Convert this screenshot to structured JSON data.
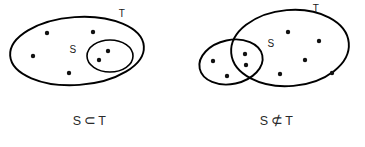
{
  "figure": {
    "background_color": "#ffffff",
    "stroke_color": "#000000",
    "dot_color": "#111111",
    "title": ""
  },
  "panels": [
    {
      "id": "subset",
      "name": "subset-panel",
      "caption": {
        "left_operand": "S",
        "relation_symbol": "⊂",
        "relation_name": "subset-of",
        "right_operand": "T",
        "full_text": "S ⊂ T"
      },
      "sets": [
        {
          "label": "T",
          "role": "outer-set",
          "label_x": 122,
          "label_y": 17,
          "shape": "ellipse",
          "cx": 77,
          "cy": 51,
          "rx": 67,
          "ry": 34,
          "rotation": -4
        },
        {
          "label": "S",
          "role": "inner-set",
          "label_x": 73,
          "label_y": 53,
          "shape": "ellipse",
          "cx": 110,
          "cy": 56,
          "rx": 23,
          "ry": 16,
          "rotation": 0
        }
      ],
      "dots": [
        {
          "x": 47,
          "y": 33,
          "region": "T-only"
        },
        {
          "x": 93,
          "y": 32,
          "region": "T-only"
        },
        {
          "x": 33,
          "y": 56,
          "region": "T-only"
        },
        {
          "x": 69,
          "y": 73,
          "region": "T-only"
        },
        {
          "x": 108,
          "y": 51,
          "region": "S"
        },
        {
          "x": 99,
          "y": 60,
          "region": "S"
        }
      ],
      "dot_counts": {
        "T_only": 4,
        "S": 2,
        "S_outside_T": 0
      }
    },
    {
      "id": "not-subset",
      "name": "not-subset-panel",
      "caption": {
        "left_operand": "S",
        "relation_symbol": "⊄",
        "relation_name": "not-subset-of",
        "right_operand": "T",
        "full_text": "S ⊄ T"
      },
      "sets": [
        {
          "label": "T",
          "role": "outer-set",
          "label_x": 133,
          "label_y": 10,
          "shape": "ellipse",
          "cx": 107,
          "cy": 48,
          "rx": 59,
          "ry": 38,
          "rotation": -5
        },
        {
          "label": "S",
          "role": "overlapping-set",
          "label_x": 109,
          "label_y": 47,
          "shape": "ellipse",
          "cx": 48,
          "cy": 62,
          "rx": 32,
          "ry": 22,
          "rotation": -12
        }
      ],
      "dots": [
        {
          "x": 30,
          "y": 61,
          "region": "S-only"
        },
        {
          "x": 44,
          "y": 76,
          "region": "S-only"
        },
        {
          "x": 62,
          "y": 54,
          "region": "S-and-T"
        },
        {
          "x": 63,
          "y": 65,
          "region": "S-and-T"
        },
        {
          "x": 105,
          "y": 32,
          "region": "T-only"
        },
        {
          "x": 136,
          "y": 41,
          "region": "T-only"
        },
        {
          "x": 122,
          "y": 60,
          "region": "T-only"
        },
        {
          "x": 97,
          "y": 74,
          "region": "T-only"
        },
        {
          "x": 149,
          "y": 73,
          "region": "T-only"
        }
      ],
      "dot_counts": {
        "S_only": 2,
        "S_and_T": 2,
        "T_only": 5
      }
    }
  ]
}
